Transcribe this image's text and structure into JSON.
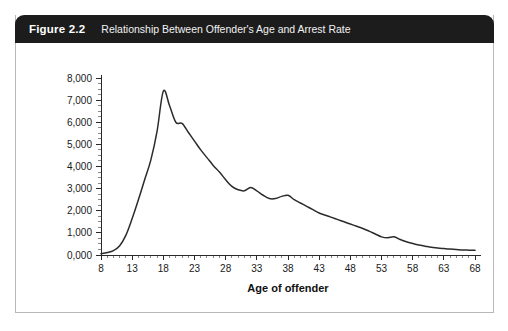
{
  "figure": {
    "number": "Figure 2.2",
    "title": "Relationship Between Offender's Age and Arrest Rate",
    "header_background": "#1c1c1c",
    "header_text_color": "#ffffff"
  },
  "chart_data": {
    "type": "line",
    "title": "Relationship Between Offender's Age and Arrest Rate",
    "xlabel": "Age of offender",
    "ylabel": "",
    "xlim": [
      8,
      68
    ],
    "ylim": [
      0,
      8000
    ],
    "grid": false,
    "legend": null,
    "line_color": "#2b2b2b",
    "x_tick_labels": [
      "8",
      "13",
      "18",
      "23",
      "28",
      "33",
      "38",
      "43",
      "48",
      "53",
      "58",
      "63",
      "68"
    ],
    "x_tick_values": [
      8,
      13,
      18,
      23,
      28,
      33,
      38,
      43,
      48,
      53,
      58,
      63,
      68
    ],
    "x_minor_step": 1,
    "y_tick_labels": [
      "0,000",
      "1,000",
      "2,000",
      "3,000",
      "4,000",
      "5,000",
      "6,000",
      "7,000",
      "8,000"
    ],
    "y_tick_values": [
      0,
      1000,
      2000,
      3000,
      4000,
      5000,
      6000,
      7000,
      8000
    ],
    "y_minor_step": 250,
    "series": [
      {
        "name": "Arrest rate",
        "x": [
          8,
          9,
          10,
          11,
          12,
          13,
          14,
          15,
          16,
          17,
          18,
          19,
          20,
          21,
          22,
          23,
          24,
          25,
          26,
          27,
          28,
          29,
          30,
          31,
          32,
          33,
          34,
          35,
          36,
          37,
          38,
          39,
          40,
          41,
          42,
          43,
          44,
          45,
          46,
          47,
          48,
          49,
          50,
          51,
          52,
          53,
          54,
          55,
          56,
          57,
          58,
          59,
          60,
          61,
          62,
          63,
          64,
          65,
          66,
          67,
          68
        ],
        "values": [
          60,
          110,
          200,
          420,
          900,
          1650,
          2500,
          3400,
          4300,
          5600,
          7400,
          6750,
          6000,
          5950,
          5550,
          5150,
          4750,
          4400,
          4050,
          3750,
          3400,
          3100,
          2950,
          2900,
          3050,
          2900,
          2700,
          2550,
          2550,
          2650,
          2700,
          2500,
          2350,
          2200,
          2050,
          1900,
          1800,
          1700,
          1600,
          1500,
          1400,
          1300,
          1200,
          1080,
          950,
          820,
          780,
          820,
          700,
          600,
          520,
          450,
          400,
          350,
          320,
          290,
          270,
          250,
          230,
          220,
          210
        ]
      }
    ]
  }
}
